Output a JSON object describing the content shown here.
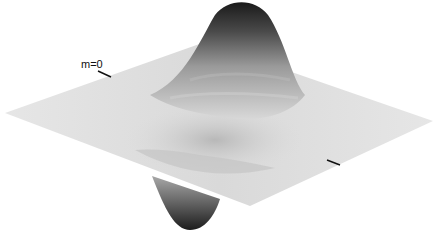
{
  "figure": {
    "type": "3d-surface",
    "mode_label": "m=0",
    "colors": {
      "background": "#ffffff",
      "plane": "#e2e2e2",
      "peak": "#1a1a1a",
      "axis_tick": "#111111"
    }
  }
}
